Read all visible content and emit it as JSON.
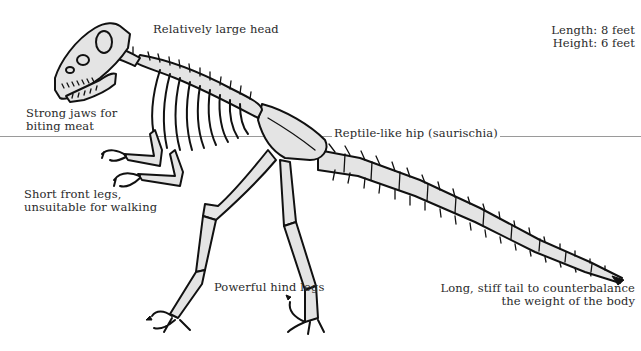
{
  "diagram": {
    "stats": {
      "length": "Length: 8 feet",
      "height": "Height: 6 feet"
    },
    "labels": {
      "head": "Relatively large head",
      "jaws_line1": "Strong jaws for",
      "jaws_line2": "biting meat",
      "hip": "Reptile-like hip (saurischia)",
      "front_legs_line1": "Short front legs,",
      "front_legs_line2": "unsuitable for walking",
      "hind_legs": "Powerful hind legs",
      "tail_line1": "Long, stiff tail to counterbalance",
      "tail_line2": "the weight of the body"
    },
    "colors": {
      "background": "#ffffff",
      "bone_fill": "#e4e4e4",
      "outline": "#111111",
      "text": "#2a2a2a",
      "rule_line": "#9a9a9a"
    }
  }
}
